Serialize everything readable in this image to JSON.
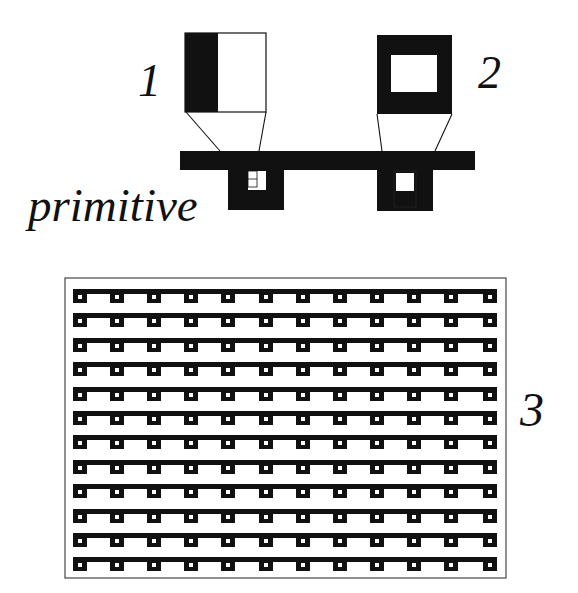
{
  "figure": {
    "labels": {
      "one": "1",
      "two": "2",
      "three": "3",
      "primitive": "primitive"
    },
    "colors": {
      "ink": "#111111",
      "paper": "#ffffff",
      "frame": "#555555"
    },
    "pattern_1": {
      "description": "Box split vertically: left third black, right two-thirds white",
      "box": {
        "x": 185,
        "y": 33,
        "w": 81,
        "h": 79
      },
      "black_width": 33
    },
    "pattern_2": {
      "description": "Thick black square ring with white center",
      "box": {
        "x": 377,
        "y": 35,
        "w": 75,
        "h": 79
      },
      "inner": {
        "x": 391,
        "y": 55,
        "w": 46,
        "h": 37
      }
    },
    "primitive_bar": {
      "x": 180,
      "y": 151,
      "w": 295,
      "h": 19
    },
    "primitives": [
      {
        "name": "primitive-1",
        "x": 228,
        "y": 170,
        "w": 56,
        "h": 40,
        "hole": {
          "x": 248,
          "y": 171,
          "w": 18,
          "h": 19
        }
      },
      {
        "name": "primitive-2",
        "x": 377,
        "y": 170,
        "w": 56,
        "h": 41,
        "hole": {
          "x": 396,
          "y": 173,
          "w": 18,
          "h": 18
        }
      }
    ],
    "array_3": {
      "frame": {
        "x": 65,
        "y": 278,
        "w": 441,
        "h": 300
      },
      "rows": 12,
      "cols": 12,
      "row_start_y": 289,
      "row_pitch": 24.4,
      "col_start_x": 73,
      "col_pitch": 37.1,
      "bar_x0": 73,
      "bar_x1": 497,
      "bar_h": 5,
      "cell_w": 14,
      "cell_h": 14,
      "hole": 4
    }
  }
}
